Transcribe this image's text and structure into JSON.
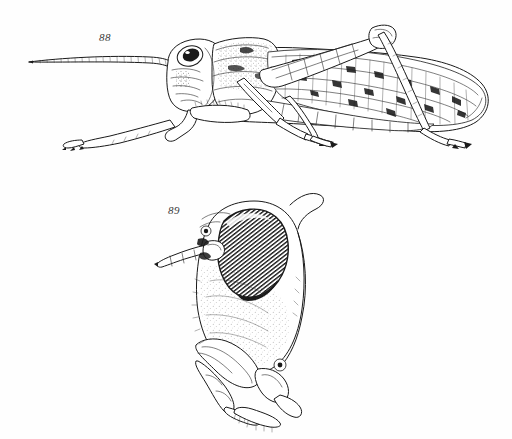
{
  "plate": {
    "background_color": "#fefefe",
    "ink_color": "#1a1a1a",
    "width": 512,
    "height": 439,
    "medium": "black-ink-line-drawing",
    "caption_color": "#3a3a3a"
  },
  "figures": [
    {
      "label": "88",
      "name": "grasshopper-lateral-habitus",
      "subject": "grasshopper (locust) whole body, left lateral view",
      "parts": [
        "antenna",
        "compound eye",
        "head",
        "pronotum",
        "tegmen (forewing)",
        "abdomen",
        "fore leg",
        "mid leg",
        "hind femur",
        "hind tibia",
        "tarsus"
      ]
    },
    {
      "label": "89",
      "name": "grasshopper-head-detail",
      "subject": "grasshopper head, antero-lateral view showing eye, antenna base and mouthparts",
      "parts": [
        "compound eye",
        "antenna base",
        "ocellus",
        "frons",
        "gena",
        "mandible",
        "maxillary palp",
        "labial palp"
      ]
    }
  ]
}
